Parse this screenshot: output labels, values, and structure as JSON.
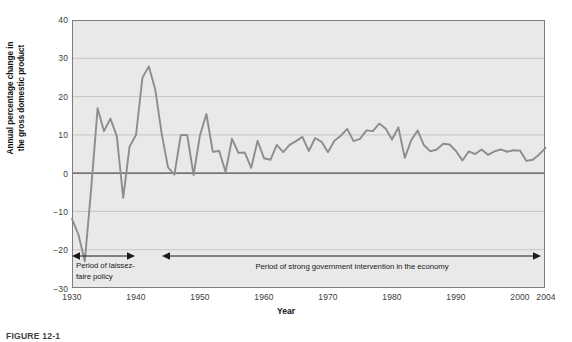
{
  "figure": {
    "caption": "FIGURE 12-1"
  },
  "chart_data": {
    "type": "line",
    "title": "",
    "xlabel": "Year",
    "ylabel": "Annual percentage change in the gross domestic product",
    "ylabel_line1": "Annual percentage change in",
    "ylabel_line2": "the gross domestic product",
    "xlim": [
      1930,
      2004
    ],
    "ylim": [
      -30,
      40
    ],
    "xticks": [
      1930,
      1940,
      1950,
      1960,
      1970,
      1980,
      1990,
      2000,
      2004
    ],
    "xtick_labels": [
      "1930",
      "1940",
      "1950",
      "1960",
      "1970",
      "1980",
      "1990",
      "2000",
      "2004"
    ],
    "yticks": [
      40,
      30,
      20,
      10,
      0,
      -10,
      -20,
      -30
    ],
    "ytick_labels": [
      "40",
      "30",
      "20",
      "10",
      "0",
      "−10",
      "−20",
      "−30"
    ],
    "grid": true,
    "grid_axis": "y",
    "legend": "none",
    "line_color": "#8d8d8d",
    "plot_background": "#e9e9e9",
    "zero_line_color": "#4a4a4a",
    "series": [
      {
        "name": "Annual percentage change in GDP",
        "x": [
          1930,
          1931,
          1932,
          1933,
          1934,
          1935,
          1936,
          1937,
          1938,
          1939,
          1940,
          1941,
          1942,
          1943,
          1944,
          1945,
          1946,
          1947,
          1948,
          1949,
          1950,
          1951,
          1952,
          1953,
          1954,
          1955,
          1956,
          1957,
          1958,
          1959,
          1960,
          1961,
          1962,
          1963,
          1964,
          1965,
          1966,
          1967,
          1968,
          1969,
          1970,
          1971,
          1972,
          1973,
          1974,
          1975,
          1976,
          1977,
          1978,
          1979,
          1980,
          1981,
          1982,
          1983,
          1984,
          1985,
          1986,
          1987,
          1988,
          1989,
          1990,
          1991,
          1992,
          1993,
          1994,
          1995,
          1996,
          1997,
          1998,
          1999,
          2000,
          2001,
          2002,
          2003,
          2004
        ],
        "y": [
          -12.0,
          -16.1,
          -23.1,
          -4.0,
          17.0,
          11.0,
          14.3,
          9.7,
          -6.5,
          7.0,
          10.0,
          25.0,
          28.0,
          22.0,
          10.5,
          1.5,
          -0.4,
          10.0,
          10.0,
          -0.5,
          10.0,
          15.5,
          5.6,
          5.8,
          0.3,
          9.0,
          5.3,
          5.4,
          1.4,
          8.5,
          3.9,
          3.5,
          7.4,
          5.5,
          7.4,
          8.4,
          9.5,
          5.8,
          9.2,
          8.2,
          5.5,
          8.5,
          9.8,
          11.6,
          8.4,
          9.0,
          11.2,
          11.0,
          13.0,
          11.7,
          8.8,
          12.0,
          4.0,
          8.6,
          11.2,
          7.3,
          5.7,
          6.2,
          7.7,
          7.5,
          5.8,
          3.3,
          5.7,
          5.0,
          6.2,
          4.8,
          5.7,
          6.2,
          5.6,
          6.0,
          5.9,
          3.2,
          3.5,
          4.9,
          6.6
        ]
      }
    ],
    "annotations": [
      {
        "id": "laissez-faire",
        "text": "Period of laissez-faire policy",
        "text_line1": "Period of laissez-",
        "text_line2": "faire policy",
        "arrow": "double",
        "from_year": 1930,
        "to_year": 1940
      },
      {
        "id": "strong-government",
        "text": "Period of strong government intervention in the economy",
        "arrow": "double",
        "from_year": 1944,
        "to_year": 2004
      }
    ]
  }
}
